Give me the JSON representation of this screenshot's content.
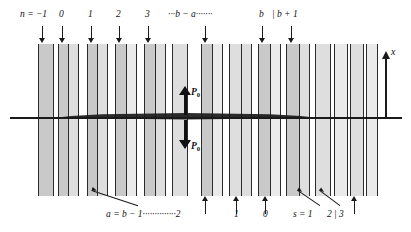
{
  "figure": {
    "colors": {
      "stripe_fill": "#c9c9c9",
      "stripe_edge": "#2b2b2b",
      "line": "#1a1a1a",
      "background": "#ffffff"
    }
  },
  "top_labels": [
    {
      "id": "n-eq-minus1",
      "text": "n = −1",
      "x": 20,
      "arrow_x": 41.5
    },
    {
      "id": "zero",
      "text": "0",
      "x": 59,
      "arrow_x": 61.5
    },
    {
      "id": "one",
      "text": "1",
      "x": 88,
      "arrow_x": 90.5
    },
    {
      "id": "two",
      "text": "2",
      "x": 116,
      "arrow_x": 118.5
    },
    {
      "id": "three",
      "text": "3",
      "x": 145,
      "arrow_x": 147.5
    },
    {
      "id": "b-minus-a",
      "text": "···b − a·······",
      "x": 168,
      "arrow_x": 204.5
    },
    {
      "id": "b",
      "text": "b",
      "x": 259,
      "arrow_x": 261.5
    },
    {
      "id": "b-plus-1",
      "text": "| b + 1",
      "x": 272,
      "arrow_x": 290.5
    }
  ],
  "bottom_labels": [
    {
      "id": "a-eq-b-minus-1",
      "text": "a = b − 1··············2",
      "x": 106,
      "arrow_x": 90.5
    },
    {
      "id": "one",
      "text": "1",
      "x": 234,
      "arrow_x": 235.5
    },
    {
      "id": "zero",
      "text": "0",
      "x": 263,
      "arrow_x": 264.5
    },
    {
      "id": "s-eq-1",
      "text": "s = 1",
      "x": 293,
      "arrow_x": 296.5
    },
    {
      "id": "two",
      "text": "2",
      "x": 327,
      "arrow_x": 325.5
    },
    {
      "id": "three",
      "text": "| 3",
      "x": 334,
      "arrow_x": 353.5
    }
  ],
  "bottom_vertical_arrows": [
    204.5,
    235.5,
    264.5,
    353.5
  ],
  "bottom_diagonal_arrows": [
    {
      "id": "arrow-to-a",
      "from_x": 138,
      "from_y": 205,
      "to_x": 92,
      "to_y": 190
    },
    {
      "id": "arrow-to-s1",
      "from_x": 320,
      "from_y": 205,
      "to_x": 298,
      "to_y": 190
    },
    {
      "id": "arrow-to-2",
      "from_x": 340,
      "from_y": 205,
      "to_x": 320,
      "to_y": 190
    }
  ],
  "center": {
    "p0_up_label": "P",
    "p0_up_sub": "0",
    "p0_down_label": "P",
    "p0_down_sub": "0"
  },
  "axis": {
    "x_label": "x"
  },
  "stripes": [
    {
      "x": 38,
      "w": 16,
      "shade": "normal"
    },
    {
      "x": 57.5,
      "w": 16,
      "shade": "normal"
    },
    {
      "x": 86.5,
      "w": 16,
      "shade": "normal"
    },
    {
      "x": 115,
      "w": 16,
      "shade": "normal"
    },
    {
      "x": 143.5,
      "w": 16,
      "shade": "normal"
    },
    {
      "x": 172,
      "w": 16,
      "shade": "pale"
    },
    {
      "x": 200.5,
      "w": 16,
      "shade": "normal"
    },
    {
      "x": 229,
      "w": 16,
      "shade": "pale"
    },
    {
      "x": 257.5,
      "w": 16,
      "shade": "normal"
    },
    {
      "x": 286,
      "w": 16,
      "shade": "normal"
    },
    {
      "x": 314.5,
      "w": 16,
      "shade": "pale"
    },
    {
      "x": 334,
      "w": 14,
      "shade": "vpale"
    },
    {
      "x": 350,
      "w": 14,
      "shade": "pale"
    },
    {
      "x": 366,
      "w": 12,
      "shade": "vpale"
    }
  ],
  "stripes_extra": [
    {
      "x": 68,
      "w": 11,
      "shade": "pale"
    },
    {
      "x": 97,
      "w": 11,
      "shade": "pale"
    },
    {
      "x": 126,
      "w": 11,
      "shade": "vpale"
    },
    {
      "x": 155,
      "w": 11,
      "shade": "pale"
    },
    {
      "x": 212,
      "w": 11,
      "shade": "vpale"
    },
    {
      "x": 241,
      "w": 11,
      "shade": "pale"
    },
    {
      "x": 270,
      "w": 11,
      "shade": "vpale"
    },
    {
      "x": 299,
      "w": 11,
      "shade": "pale"
    }
  ]
}
